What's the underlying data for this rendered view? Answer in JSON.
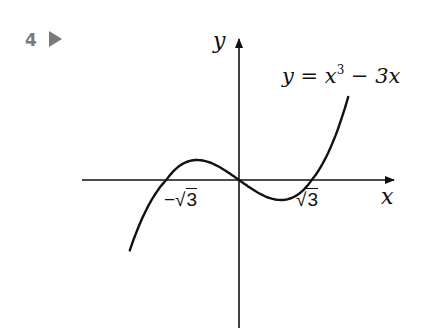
{
  "exercise": {
    "number": "4",
    "marker_icon": "right-triangle"
  },
  "chart_data": {
    "type": "line",
    "title": "",
    "function": "y = x^3 - 3x",
    "curve_label": {
      "prefix": "y = x",
      "exponent": "3",
      "suffix": " − 3x"
    },
    "xlabel": "x",
    "ylabel": "y",
    "x_tick_labels": [
      {
        "value": -1.732,
        "sign": "−",
        "radicand": "3"
      },
      {
        "value": 1.732,
        "sign": "",
        "radicand": "3"
      }
    ],
    "roots": [
      -1.732,
      0,
      1.732
    ],
    "local_max": {
      "x": -1,
      "y": 2
    },
    "local_min": {
      "x": 1,
      "y": -2
    },
    "x_range": [
      -2.6,
      2.6
    ],
    "grid": false,
    "legend": false,
    "colors": {
      "curve": "#111111",
      "axes": "#111111",
      "marker": "#7a7a7a"
    },
    "samples": [
      {
        "x": -2.6,
        "y": -9.78
      },
      {
        "x": -2.2,
        "y": -4.05
      },
      {
        "x": -1.732,
        "y": 0
      },
      {
        "x": -1.4,
        "y": 1.46
      },
      {
        "x": -1.0,
        "y": 2.0
      },
      {
        "x": -0.5,
        "y": 1.38
      },
      {
        "x": 0,
        "y": 0
      },
      {
        "x": 0.5,
        "y": -1.38
      },
      {
        "x": 1.0,
        "y": -2.0
      },
      {
        "x": 1.4,
        "y": -1.46
      },
      {
        "x": 1.732,
        "y": 0
      },
      {
        "x": 2.2,
        "y": 4.05
      },
      {
        "x": 2.6,
        "y": 9.78
      }
    ]
  }
}
